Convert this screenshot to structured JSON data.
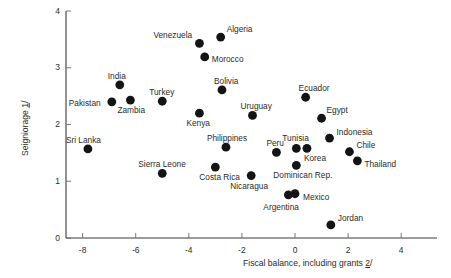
{
  "chart_data": {
    "type": "scatter",
    "title": "",
    "xlabel": "Fiscal balance, including grants 2/",
    "ylabel": "Seigniorage 1/",
    "xlabel_text": "Fiscal balance, including grants ",
    "xlabel_footnote": "2",
    "xlabel_suffix": "/",
    "ylabel_text": "Seigniorage ",
    "ylabel_footnote": "1",
    "ylabel_suffix": "/",
    "xlim": [
      -9.5,
      5.3
    ],
    "ylim": [
      0,
      4
    ],
    "xticks": [
      -8,
      -6,
      -4,
      -2,
      0,
      2,
      4
    ],
    "xtick_labels": [
      "-8",
      "-6",
      "-4",
      "-2",
      "0",
      "2",
      "4"
    ],
    "yticks": [
      0,
      1,
      2,
      3,
      4
    ],
    "ytick_labels": [
      "0",
      "1",
      "2",
      "3",
      "4"
    ],
    "grid": false,
    "legend": "none",
    "marker_color": "#141414",
    "axis_color": "#3a3a3a",
    "points": [
      {
        "name": "Venezuela",
        "x": -3.6,
        "y": 3.43,
        "label_dx": -46,
        "label_dy": -12
      },
      {
        "name": "Algeria",
        "x": -2.8,
        "y": 3.54,
        "label_dx": 6,
        "label_dy": -12
      },
      {
        "name": "Morocco",
        "x": -3.4,
        "y": 3.19,
        "label_dx": 7,
        "label_dy": -2
      },
      {
        "name": "India",
        "x": -6.6,
        "y": 2.7,
        "label_dx": -12,
        "label_dy": -13
      },
      {
        "name": "Pakistan",
        "x": -6.9,
        "y": 2.4,
        "label_dx": -43,
        "label_dy": -3
      },
      {
        "name": "Zambia",
        "x": -6.2,
        "y": 2.43,
        "label_dx": -13,
        "label_dy": 6
      },
      {
        "name": "Turkey",
        "x": -5.0,
        "y": 2.41,
        "label_dx": -13,
        "label_dy": -13
      },
      {
        "name": "Kenya",
        "x": -3.6,
        "y": 2.2,
        "label_dx": -13,
        "label_dy": 6
      },
      {
        "name": "Bolivia",
        "x": -2.75,
        "y": 2.61,
        "label_dx": -8,
        "label_dy": -13
      },
      {
        "name": "Uruguay",
        "x": -1.6,
        "y": 2.16,
        "label_dx": -12,
        "label_dy": -13
      },
      {
        "name": "Ecuador",
        "x": 0.4,
        "y": 2.48,
        "label_dx": -7,
        "label_dy": -13
      },
      {
        "name": "Egypt",
        "x": 1.0,
        "y": 2.11,
        "label_dx": 5,
        "label_dy": -12
      },
      {
        "name": "Sri Lanka",
        "x": -7.8,
        "y": 1.57,
        "label_dx": -22,
        "label_dy": -13
      },
      {
        "name": "Philippines",
        "x": -2.6,
        "y": 1.6,
        "label_dx": -19,
        "label_dy": -13
      },
      {
        "name": "Sierra Leone",
        "x": -5.0,
        "y": 1.14,
        "label_dx": -24,
        "label_dy": -13
      },
      {
        "name": "Costa Rica",
        "x": -3.0,
        "y": 1.25,
        "label_dx": -16,
        "label_dy": 6
      },
      {
        "name": "Tunisia",
        "x": 0.05,
        "y": 1.58,
        "label_dx": -14,
        "label_dy": -14
      },
      {
        "name": "Peru",
        "x": -0.7,
        "y": 1.51,
        "label_dx": -10,
        "label_dy": -13
      },
      {
        "name": "Korea",
        "x": 0.45,
        "y": 1.58,
        "label_dx": -3,
        "label_dy": 6
      },
      {
        "name": "Indonesia",
        "x": 1.3,
        "y": 1.76,
        "label_dx": 7,
        "label_dy": -10
      },
      {
        "name": "Chile",
        "x": 2.05,
        "y": 1.52,
        "label_dx": 7,
        "label_dy": -11
      },
      {
        "name": "Thailand",
        "x": 2.35,
        "y": 1.36,
        "label_dx": 7,
        "label_dy": -1
      },
      {
        "name": "Dominican Rep.",
        "x": 0.05,
        "y": 1.28,
        "label_dx": -23,
        "label_dy": 6
      },
      {
        "name": "Nicaragua",
        "x": -1.65,
        "y": 1.1,
        "label_dx": -21,
        "label_dy": 6
      },
      {
        "name": "Argentina",
        "x": -0.25,
        "y": 0.76,
        "label_dx": -25,
        "label_dy": 8
      },
      {
        "name": "Mexico",
        "x": 0.0,
        "y": 0.78,
        "label_dx": 8,
        "label_dy": -1
      },
      {
        "name": "Jordan",
        "x": 1.35,
        "y": 0.23,
        "label_dx": 7,
        "label_dy": -11
      }
    ]
  },
  "geometry": {
    "x_pixel_at_zero": 295.0,
    "x_pixels_per_unit": 26.55,
    "y_pixel_at_zero": 238.0,
    "y_pixels_per_unit": 56.75,
    "axis_x_left": 66.0,
    "axis_x_right": 437.0,
    "axis_y_top": 11.0,
    "dot_radius": 4.4
  }
}
